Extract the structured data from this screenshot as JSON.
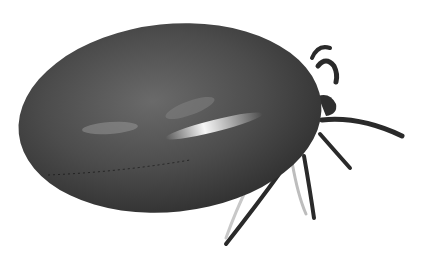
{
  "image": {
    "subject": "engorged tick",
    "style": "grayscale photograph",
    "background": "#ffffff",
    "colors": {
      "body_dark": "#3a3a3a",
      "body_mid": "#5a5a5a",
      "highlight": "#f2f2f2",
      "legs": "#2a2a2a"
    }
  }
}
